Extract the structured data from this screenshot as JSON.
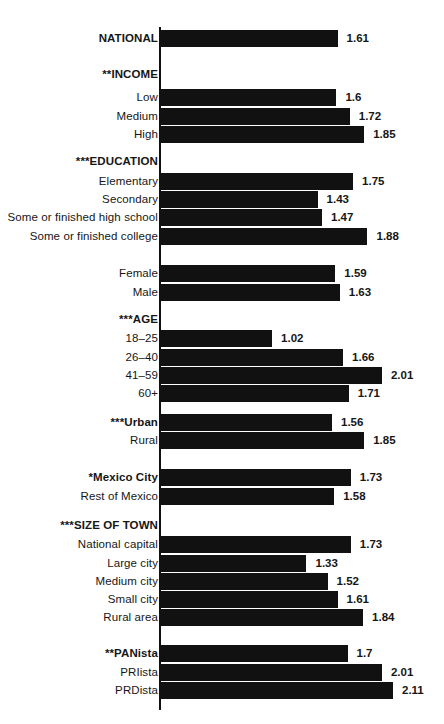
{
  "chart_data": {
    "type": "bar",
    "orientation": "horizontal",
    "title": "",
    "subtitle": "",
    "xlabel": "",
    "ylabel": "",
    "xlim": [
      0,
      2.11
    ],
    "grid": false,
    "legend": null,
    "bar_color": "#111111",
    "axis_color": "#111111",
    "background": "#ffffff",
    "categories": [
      "NATIONAL",
      "**INCOME",
      "Low",
      "Medium",
      "High",
      "***EDUCATION",
      "Elementary",
      "Secondary",
      "Some or finished high school",
      "Some or finished college",
      "Female",
      "Male",
      "***AGE",
      "18–25",
      "26–40",
      "41–59",
      "60+",
      "***Urban",
      "Rural",
      "*Mexico City",
      "Rest of Mexico",
      "***SIZE OF TOWN",
      "National capital",
      "Large city",
      "Medium city",
      "Small city",
      "Rural area",
      "**PANista",
      "PRIista",
      "PRDista"
    ],
    "values": [
      1.61,
      null,
      1.6,
      1.72,
      1.85,
      null,
      1.75,
      1.43,
      1.47,
      1.88,
      1.59,
      1.63,
      null,
      1.02,
      1.66,
      2.01,
      1.71,
      1.56,
      1.85,
      1.73,
      1.58,
      null,
      1.73,
      1.33,
      1.52,
      1.61,
      1.84,
      1.7,
      2.01,
      2.11
    ]
  },
  "rows": [
    {
      "label": "NATIONAL",
      "value": 1.61,
      "value_text": "1.61",
      "heading": true,
      "y": 29
    },
    {
      "label": "**INCOME",
      "value": null,
      "value_text": "",
      "heading": true,
      "y": 65
    },
    {
      "label": "Low",
      "value": 1.6,
      "value_text": "1.6",
      "heading": false,
      "y": 88
    },
    {
      "label": "Medium",
      "value": 1.72,
      "value_text": "1.72",
      "heading": false,
      "y": 107
    },
    {
      "label": "High",
      "value": 1.85,
      "value_text": "1.85",
      "heading": false,
      "y": 125
    },
    {
      "label": "***EDUCATION",
      "value": null,
      "value_text": "",
      "heading": true,
      "y": 152
    },
    {
      "label": "Elementary",
      "value": 1.75,
      "value_text": "1.75",
      "heading": false,
      "y": 172
    },
    {
      "label": "Secondary",
      "value": 1.43,
      "value_text": "1.43",
      "heading": false,
      "y": 190
    },
    {
      "label": "Some or finished high school",
      "value": 1.47,
      "value_text": "1.47",
      "heading": false,
      "y": 208
    },
    {
      "label": "Some or finished college",
      "value": 1.88,
      "value_text": "1.88",
      "heading": false,
      "y": 227
    },
    {
      "label": "Female",
      "value": 1.59,
      "value_text": "1.59",
      "heading": false,
      "y": 264
    },
    {
      "label": "Male",
      "value": 1.63,
      "value_text": "1.63",
      "heading": false,
      "y": 283
    },
    {
      "label": "***AGE",
      "value": null,
      "value_text": "",
      "heading": true,
      "y": 310
    },
    {
      "label": "18–25",
      "value": 1.02,
      "value_text": "1.02",
      "heading": false,
      "y": 329
    },
    {
      "label": "26–40",
      "value": 1.66,
      "value_text": "1.66",
      "heading": false,
      "y": 348
    },
    {
      "label": "41–59",
      "value": 2.01,
      "value_text": "2.01",
      "heading": false,
      "y": 366
    },
    {
      "label": "60+",
      "value": 1.71,
      "value_text": "1.71",
      "heading": false,
      "y": 384
    },
    {
      "label": "***Urban",
      "value": 1.56,
      "value_text": "1.56",
      "heading": true,
      "y": 413
    },
    {
      "label": "Rural",
      "value": 1.85,
      "value_text": "1.85",
      "heading": false,
      "y": 431
    },
    {
      "label": "*Mexico City",
      "value": 1.73,
      "value_text": "1.73",
      "heading": true,
      "y": 468
    },
    {
      "label": "Rest of Mexico",
      "value": 1.58,
      "value_text": "1.58",
      "heading": false,
      "y": 487
    },
    {
      "label": "***SIZE OF TOWN",
      "value": null,
      "value_text": "",
      "heading": true,
      "y": 516
    },
    {
      "label": "National capital",
      "value": 1.73,
      "value_text": "1.73",
      "heading": false,
      "y": 535
    },
    {
      "label": "Large city",
      "value": 1.33,
      "value_text": "1.33",
      "heading": false,
      "y": 554
    },
    {
      "label": "Medium city",
      "value": 1.52,
      "value_text": "1.52",
      "heading": false,
      "y": 572
    },
    {
      "label": "Small city",
      "value": 1.61,
      "value_text": "1.61",
      "heading": false,
      "y": 590
    },
    {
      "label": "Rural area",
      "value": 1.84,
      "value_text": "1.84",
      "heading": false,
      "y": 608
    },
    {
      "label": "**PANista",
      "value": 1.7,
      "value_text": "1.7",
      "heading": true,
      "y": 644
    },
    {
      "label": "PRIista",
      "value": 2.01,
      "value_text": "2.01",
      "heading": false,
      "y": 663
    },
    {
      "label": "PRDista",
      "value": 2.11,
      "value_text": "2.11",
      "heading": false,
      "y": 681
    }
  ],
  "geometry": {
    "axis_x": 159,
    "axis_top": 27,
    "axis_bottom": 710,
    "px_per_unit": 110.9,
    "value_gap": 9
  }
}
